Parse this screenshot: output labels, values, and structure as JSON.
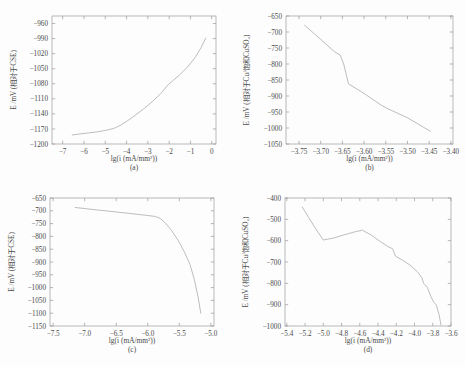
{
  "figure": {
    "background": "#fdfdfd",
    "line_color": "#bdbdbd",
    "axis_color": "#9a9a9a"
  },
  "chart_data": [
    {
      "id": "a",
      "type": "line",
      "panel_label": "(a)",
      "title": "",
      "xlabel": "lg(i (mA/mm²))",
      "ylabel": "E /mV (相对于CSE)",
      "xlim": [
        -7.5,
        0.2
      ],
      "ylim": [
        -1200,
        -945
      ],
      "xticks": [
        -7,
        -6,
        -5,
        -4,
        -3,
        -2,
        -1,
        0
      ],
      "yticks": [
        -1200,
        -1170,
        -1140,
        -1110,
        -1080,
        -1050,
        -1020,
        -990,
        -960
      ],
      "grid": false,
      "legend": "none",
      "x": [
        -6.55,
        -6.2,
        -5.8,
        -5.4,
        -5.0,
        -4.6,
        -4.3,
        -4.0,
        -3.6,
        -3.2,
        -2.8,
        -2.4,
        -2.05,
        -1.8,
        -1.5,
        -1.15,
        -0.8,
        -0.5,
        -0.28
      ],
      "y": [
        -1182,
        -1180,
        -1178,
        -1176,
        -1173,
        -1169,
        -1163,
        -1155,
        -1143,
        -1130,
        -1116,
        -1100,
        -1082,
        -1073,
        -1062,
        -1047,
        -1029,
        -1008,
        -989
      ]
    },
    {
      "id": "b",
      "type": "line",
      "panel_label": "(b)",
      "title": "",
      "xlabel": "lg(i (mA/mm²))",
      "ylabel": "E /mV (相对于Cu/饱和CuSO₄)",
      "xlim": [
        -3.78,
        -3.395
      ],
      "ylim": [
        -1050,
        -650
      ],
      "xticks": [
        -3.75,
        -3.7,
        -3.65,
        -3.6,
        -3.55,
        -3.5,
        -3.45,
        -3.4
      ],
      "yticks": [
        -1050,
        -1000,
        -950,
        -900,
        -850,
        -800,
        -750,
        -700,
        -650
      ],
      "grid": false,
      "legend": "none",
      "x": [
        -3.737,
        -3.7,
        -3.668,
        -3.655,
        -3.647,
        -3.636,
        -3.6,
        -3.56,
        -3.545,
        -3.5,
        -3.46,
        -3.447
      ],
      "y": [
        -679,
        -723,
        -762,
        -772,
        -800,
        -862,
        -892,
        -929,
        -940,
        -968,
        -1000,
        -1010
      ]
    },
    {
      "id": "c",
      "type": "line",
      "panel_label": "(c)",
      "title": "",
      "xlabel": "lg(i (mA/mm²))",
      "ylabel": "E /mV (相对于CSE)",
      "xlim": [
        -7.55,
        -4.95
      ],
      "ylim": [
        -1150,
        -650
      ],
      "xticks": [
        -7.5,
        -7.0,
        -6.5,
        -6.0,
        -5.5,
        -5.0
      ],
      "yticks": [
        -1150,
        -1100,
        -1050,
        -1000,
        -950,
        -900,
        -850,
        -800,
        -750,
        -700,
        -650
      ],
      "grid": false,
      "legend": "none",
      "x": [
        -7.15,
        -6.9,
        -6.6,
        -6.3,
        -6.05,
        -5.88,
        -5.8,
        -5.72,
        -5.62,
        -5.52,
        -5.42,
        -5.33,
        -5.26,
        -5.2,
        -5.16
      ],
      "y": [
        -687,
        -694,
        -702,
        -710,
        -717,
        -722,
        -730,
        -748,
        -778,
        -815,
        -860,
        -910,
        -970,
        -1040,
        -1100
      ]
    },
    {
      "id": "d",
      "type": "line",
      "panel_label": "(d)",
      "title": "",
      "xlabel": "lg(i (mA/mm²))",
      "ylabel": "E /mV (相对于Cu/饱和CuSO₄)",
      "xlim": [
        -5.42,
        -3.6
      ],
      "ylim": [
        -1000,
        -400
      ],
      "xticks": [
        -5.4,
        -5.2,
        -5.0,
        -4.8,
        -4.6,
        -4.4,
        -4.2,
        -4.0,
        -3.8,
        -3.6
      ],
      "yticks": [
        -1000,
        -900,
        -800,
        -700,
        -600,
        -500,
        -400
      ],
      "grid": false,
      "legend": "none",
      "x": [
        -5.23,
        -5.16,
        -5.08,
        -5.0,
        -4.88,
        -4.75,
        -4.65,
        -4.57,
        -4.47,
        -4.38,
        -4.29,
        -4.24,
        -4.21,
        -4.13,
        -4.05,
        -3.97,
        -3.92,
        -3.9,
        -3.86,
        -3.82,
        -3.79,
        -3.76,
        -3.73,
        -3.71
      ],
      "y": [
        -443,
        -492,
        -546,
        -597,
        -587,
        -570,
        -558,
        -551,
        -575,
        -603,
        -628,
        -638,
        -672,
        -692,
        -714,
        -745,
        -773,
        -800,
        -818,
        -862,
        -888,
        -902,
        -948,
        -995
      ]
    }
  ]
}
